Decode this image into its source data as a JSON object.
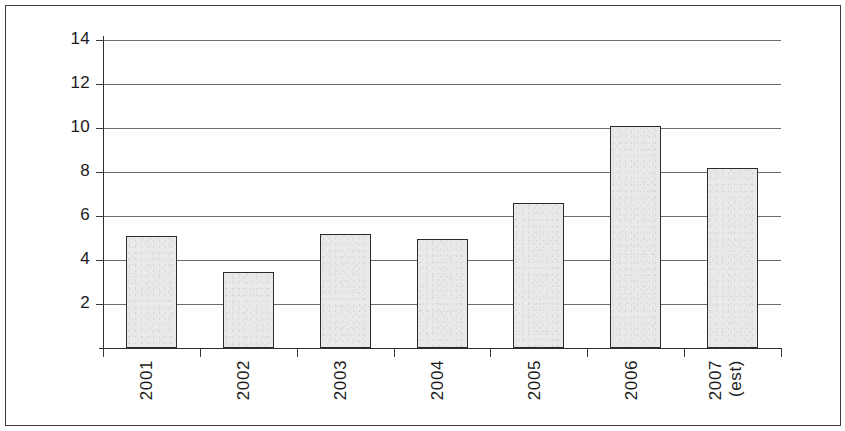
{
  "chart_data": {
    "type": "bar",
    "title": "",
    "subtitle": "",
    "xlabel": "",
    "ylabel": "",
    "categories": [
      "2001",
      "2002",
      "2003",
      "2004",
      "2005",
      "2006",
      "2007"
    ],
    "category_sublabels": [
      "",
      "",
      "",
      "",
      "",
      "",
      "(est)"
    ],
    "values": [
      5.1,
      3.45,
      5.2,
      4.95,
      6.6,
      10.1,
      8.2
    ],
    "ylim": [
      0,
      14
    ],
    "ytick_labels": [
      "2",
      "4",
      "6",
      "8",
      "10",
      "12",
      "14"
    ],
    "ytick_values": [
      2,
      4,
      6,
      8,
      10,
      12,
      14
    ],
    "grid": true,
    "legend": false,
    "legend_position": "none",
    "bar_fill_color": "#e9e9e9",
    "bar_border_color": "#2b2b2b",
    "gridline_color": "#6e6e6e",
    "axis_color": "#2f2f2f",
    "background_color": "#ffffff",
    "frame_color": "#3b3b3b",
    "label_rotation_degrees": 90
  }
}
